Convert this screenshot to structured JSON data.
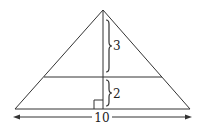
{
  "diagram": {
    "type": "geometry",
    "shape": "isosceles-triangle",
    "labels": {
      "upper_height": "3",
      "lower_height": "2",
      "base": "10"
    },
    "elements": [
      "triangle-outline",
      "altitude-line",
      "horizontal-cross-section-line",
      "right-angle-marker",
      "brace-upper-segment",
      "brace-lower-segment",
      "base-dimension-arrow"
    ],
    "colors": {
      "stroke": "#333333",
      "text": "#222222",
      "background": "#ffffff"
    }
  }
}
